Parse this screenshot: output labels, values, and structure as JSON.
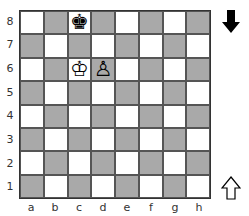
{
  "board": {
    "files": [
      "a",
      "b",
      "c",
      "d",
      "e",
      "f",
      "g",
      "h"
    ],
    "ranks": [
      "8",
      "7",
      "6",
      "5",
      "4",
      "3",
      "2",
      "1"
    ],
    "colors": {
      "light": "#ffffff",
      "dark": "#a9a9a9"
    },
    "pieces": [
      {
        "square": "c8",
        "color": "black",
        "type": "king",
        "glyph": "♚"
      },
      {
        "square": "c6",
        "color": "white",
        "type": "king",
        "glyph": "♔"
      },
      {
        "square": "d6",
        "color": "white",
        "type": "pawn",
        "glyph": "♙"
      }
    ]
  },
  "side_to_move": {
    "top_arrow": {
      "icon": "black-arrow-down-icon",
      "meaning": "black"
    },
    "bottom_arrow": {
      "icon": "white-arrow-up-icon",
      "meaning": "white"
    }
  }
}
